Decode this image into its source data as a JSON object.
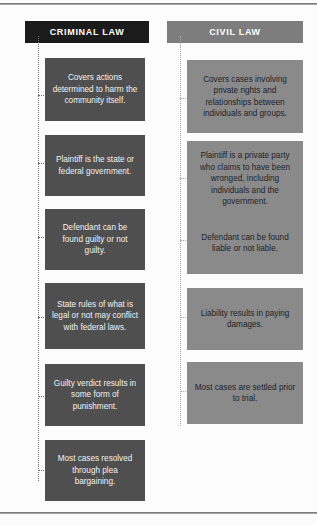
{
  "meta": {
    "colors": {
      "criminal_header_bg": "#1b1b1b",
      "criminal_box_bg": "#4f4f4f",
      "criminal_box_text": "#f2f2f2",
      "civil_header_bg": "#7d7d7d",
      "civil_box_bg": "#8a8a8a",
      "civil_box_text": "#20242a",
      "page_bg": "#fcfcfc",
      "rule": "#6e6e6e",
      "connector_criminal": "#6d6d6d",
      "connector_civil": "#a8a8a8"
    }
  },
  "columns": [
    {
      "id": "criminal",
      "header": "CRIMINAL LAW",
      "items": [
        {
          "text": "Covers actions determined to harm the community itself."
        },
        {
          "text": "Plaintiff is the state or federal government."
        },
        {
          "text": "Defendant can be found guilty or not guilty."
        },
        {
          "text": "State rules of what is legal or not may conflict with federal laws."
        },
        {
          "text": "Guilty verdict results in some form of punishment."
        },
        {
          "text": "Most cases resolved through plea bargaining."
        }
      ]
    },
    {
      "id": "civil",
      "header": "CIVIL LAW",
      "items": [
        {
          "text": "Covers cases involving private rights and relationships between individuals and groups."
        },
        {
          "text": "Plaintiff is a private party who claims to have been wronged, including individuals and the government."
        },
        {
          "text": "Defendant can be found liable or not liable."
        },
        {
          "text": "Liability results in paying damages."
        },
        {
          "text": "Most cases are settled prior to trial."
        }
      ]
    }
  ]
}
